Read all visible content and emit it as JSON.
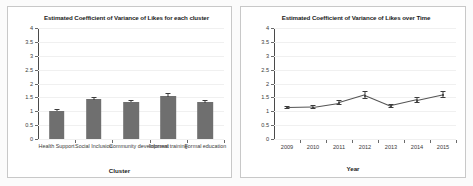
{
  "chart_data": [
    {
      "type": "bar",
      "title": "Estimated Coefficient of Variance of Likes for each cluster",
      "xlabel": "Cluster",
      "ylabel": "",
      "categories": [
        "Health Support",
        "Social Inclusion",
        "Community development",
        "Informal training",
        "Formal education"
      ],
      "values": [
        1.02,
        1.43,
        1.35,
        1.55,
        1.33
      ],
      "errors": [
        0.07,
        0.08,
        0.07,
        0.1,
        0.07
      ],
      "yticks": [
        "4",
        "3.5",
        "3",
        "2.5",
        "2",
        "1.5",
        "1",
        "0.5",
        "0"
      ],
      "ylim": [
        0,
        4
      ],
      "grid": false,
      "legend": "none",
      "bar_color": "#6f6f6f"
    },
    {
      "type": "line",
      "title": "Estimated Coefficient of Variance  of Likes over Time",
      "xlabel": "Year",
      "ylabel": "",
      "x": [
        "2009",
        "2010",
        "2011",
        "2012",
        "2013",
        "2014",
        "2015"
      ],
      "values": [
        1.15,
        1.17,
        1.32,
        1.6,
        1.21,
        1.42,
        1.62
      ],
      "errors": [
        0.05,
        0.06,
        0.07,
        0.12,
        0.06,
        0.1,
        0.12
      ],
      "yticks": [
        "4",
        "3.5",
        "3",
        "2.5",
        "2",
        "1.5",
        "1",
        "0.5",
        "0"
      ],
      "ylim": [
        0,
        4
      ],
      "grid": false,
      "legend": "none",
      "line_color": "#545454"
    }
  ]
}
